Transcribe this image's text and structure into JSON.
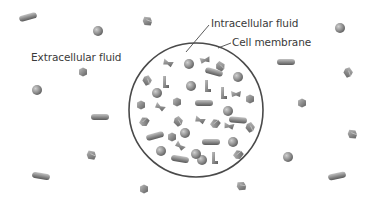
{
  "diagram": {
    "labels": {
      "extracellular": "Extracellular fluid",
      "intracellular": "Intracellular fluid",
      "membrane": "Cell membrane"
    },
    "colors": {
      "background": "#ffffff",
      "membrane": "#4a4a4a",
      "particle_light": "#b5b5b5",
      "particle_dark": "#6e6e6e",
      "text": "#3a3a3a"
    },
    "cell": {
      "cx": 196,
      "cy": 110,
      "r": 67
    },
    "leaders": [
      {
        "x1": 186,
        "y1": 52,
        "x2": 209,
        "y2": 25
      },
      {
        "x1": 218,
        "y1": 48,
        "x2": 231,
        "y2": 43
      }
    ],
    "particles": [
      {
        "type": "rod",
        "x": 28,
        "y": 17,
        "angle": -15,
        "zone": "outside"
      },
      {
        "type": "sphere",
        "x": 98,
        "y": 31,
        "zone": "outside"
      },
      {
        "type": "cube",
        "x": 147,
        "y": 21,
        "angle": 20,
        "zone": "outside"
      },
      {
        "type": "hex",
        "x": 83,
        "y": 72,
        "zone": "outside"
      },
      {
        "type": "sphere",
        "x": 37,
        "y": 90,
        "zone": "outside"
      },
      {
        "type": "rod",
        "x": 100,
        "y": 117,
        "angle": 0,
        "zone": "outside"
      },
      {
        "type": "cube",
        "x": 91,
        "y": 155,
        "angle": 25,
        "zone": "outside"
      },
      {
        "type": "rod",
        "x": 41,
        "y": 176,
        "angle": 10,
        "zone": "outside"
      },
      {
        "type": "hex",
        "x": 144,
        "y": 189,
        "zone": "outside"
      },
      {
        "type": "cube",
        "x": 241,
        "y": 186,
        "angle": 10,
        "zone": "outside"
      },
      {
        "type": "sphere",
        "x": 288,
        "y": 157,
        "zone": "outside"
      },
      {
        "type": "hex",
        "x": 302,
        "y": 103,
        "zone": "outside"
      },
      {
        "type": "rod",
        "x": 286,
        "y": 62,
        "angle": 0,
        "zone": "outside"
      },
      {
        "type": "sphere",
        "x": 340,
        "y": 28,
        "zone": "outside"
      },
      {
        "type": "cube",
        "x": 348,
        "y": 72,
        "angle": 70,
        "zone": "outside"
      },
      {
        "type": "cube",
        "x": 352,
        "y": 134,
        "angle": 20,
        "zone": "outside"
      },
      {
        "type": "rod",
        "x": 337,
        "y": 176,
        "angle": -12,
        "zone": "outside"
      },
      {
        "type": "bent",
        "x": 168,
        "y": 63,
        "angle": 20,
        "zone": "inside"
      },
      {
        "type": "sphere",
        "x": 189,
        "y": 64,
        "zone": "inside"
      },
      {
        "type": "bent",
        "x": 205,
        "y": 60,
        "angle": -10,
        "zone": "inside"
      },
      {
        "type": "cube",
        "x": 220,
        "y": 66,
        "angle": 45,
        "zone": "inside"
      },
      {
        "type": "cube",
        "x": 147,
        "y": 80,
        "angle": 70,
        "zone": "inside"
      },
      {
        "type": "lshape",
        "x": 165,
        "y": 82,
        "angle": 0,
        "zone": "inside"
      },
      {
        "type": "sphere",
        "x": 157,
        "y": 93,
        "zone": "inside"
      },
      {
        "type": "sphere",
        "x": 191,
        "y": 86,
        "zone": "inside"
      },
      {
        "type": "lshape",
        "x": 207,
        "y": 86,
        "angle": 0,
        "zone": "inside"
      },
      {
        "type": "rod",
        "x": 214,
        "y": 72,
        "angle": 15,
        "zone": "inside"
      },
      {
        "type": "sphere",
        "x": 238,
        "y": 77,
        "zone": "inside"
      },
      {
        "type": "lshape",
        "x": 223,
        "y": 93,
        "angle": 0,
        "zone": "inside"
      },
      {
        "type": "bent",
        "x": 236,
        "y": 94,
        "angle": 0,
        "zone": "inside"
      },
      {
        "type": "hex",
        "x": 250,
        "y": 99,
        "zone": "inside"
      },
      {
        "type": "hex",
        "x": 141,
        "y": 105,
        "zone": "inside"
      },
      {
        "type": "bent",
        "x": 160,
        "y": 107,
        "angle": 30,
        "zone": "inside"
      },
      {
        "type": "hex",
        "x": 177,
        "y": 102,
        "zone": "inside"
      },
      {
        "type": "rod",
        "x": 204,
        "y": 103,
        "angle": 0,
        "zone": "inside"
      },
      {
        "type": "sphere",
        "x": 228,
        "y": 111,
        "zone": "inside"
      },
      {
        "type": "rod",
        "x": 238,
        "y": 120,
        "angle": 5,
        "zone": "inside"
      },
      {
        "type": "cube",
        "x": 144,
        "y": 122,
        "angle": -45,
        "zone": "inside"
      },
      {
        "type": "cube",
        "x": 178,
        "y": 121,
        "angle": 60,
        "zone": "inside"
      },
      {
        "type": "bent",
        "x": 200,
        "y": 120,
        "angle": 20,
        "zone": "inside"
      },
      {
        "type": "cube",
        "x": 215,
        "y": 124,
        "angle": -40,
        "zone": "inside"
      },
      {
        "type": "bent",
        "x": 229,
        "y": 126,
        "angle": 10,
        "zone": "inside"
      },
      {
        "type": "cube",
        "x": 250,
        "y": 127,
        "angle": 65,
        "zone": "inside"
      },
      {
        "type": "rod",
        "x": 155,
        "y": 136,
        "angle": -15,
        "zone": "inside"
      },
      {
        "type": "hex",
        "x": 172,
        "y": 137,
        "zone": "inside"
      },
      {
        "type": "sphere",
        "x": 185,
        "y": 133,
        "zone": "inside"
      },
      {
        "type": "bent",
        "x": 180,
        "y": 146,
        "angle": 40,
        "zone": "inside"
      },
      {
        "type": "rod",
        "x": 211,
        "y": 142,
        "angle": 0,
        "zone": "inside"
      },
      {
        "type": "sphere",
        "x": 233,
        "y": 142,
        "zone": "inside"
      },
      {
        "type": "sphere",
        "x": 161,
        "y": 151,
        "zone": "inside"
      },
      {
        "type": "rod",
        "x": 180,
        "y": 159,
        "angle": 10,
        "zone": "inside"
      },
      {
        "type": "sphere",
        "x": 202,
        "y": 160,
        "zone": "inside"
      },
      {
        "type": "lshape",
        "x": 214,
        "y": 158,
        "angle": 0,
        "zone": "inside"
      },
      {
        "type": "cube",
        "x": 238,
        "y": 155,
        "angle": -40,
        "zone": "inside"
      },
      {
        "type": "sphere",
        "x": 196,
        "y": 154,
        "zone": "inside"
      }
    ]
  }
}
